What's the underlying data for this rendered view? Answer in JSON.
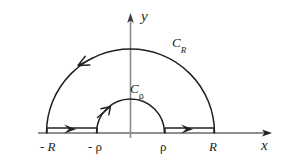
{
  "figure": {
    "kind": "complex-contour-diagram",
    "width": 283,
    "height": 161,
    "background_color": "#ffffff",
    "stroke_color": "#231f20"
  },
  "axes": {
    "x_label": "x",
    "y_label": "y",
    "origin": {
      "x": 130.5,
      "y": 133
    },
    "x_axis": {
      "start_x": 38,
      "end_x": 272,
      "y": 133,
      "arrow": "right"
    },
    "y_axis": {
      "x": 130.5,
      "top_y": 13,
      "bottom_y": 138,
      "arrow": "up"
    }
  },
  "curves": [
    {
      "name": "C_R",
      "label_base": "C",
      "label_sub": "R",
      "type": "semicircle-upper",
      "radius": 84,
      "orientation": "counterclockwise",
      "label_x": 172,
      "label_y": 36
    },
    {
      "name": "C_rho",
      "label_base": "C",
      "label_sub": "ρ",
      "type": "semicircle-upper",
      "radius": 34,
      "orientation": "counterclockwise",
      "label_x": 130,
      "label_y": 82
    }
  ],
  "segments": [
    {
      "name": "left-segment",
      "from_label": "- R",
      "to_label": "- ρ",
      "from_x": 47,
      "to_x": 97,
      "y": 128,
      "arrow": "right"
    },
    {
      "name": "right-segment",
      "from_label": "ρ",
      "to_label": "R",
      "from_x": 165,
      "to_x": 214,
      "y": 128,
      "arrow": "right"
    }
  ],
  "point_labels": [
    {
      "name": "minus-R",
      "text": "- R",
      "x": 40,
      "y": 140,
      "italic": true
    },
    {
      "name": "minus-rho",
      "text": "- ρ",
      "x": 88,
      "y": 140,
      "italic": false
    },
    {
      "name": "rho",
      "text": "ρ",
      "x": 160,
      "y": 140,
      "italic": false
    },
    {
      "name": "R",
      "text": "R",
      "x": 209,
      "y": 140,
      "italic": true
    }
  ]
}
